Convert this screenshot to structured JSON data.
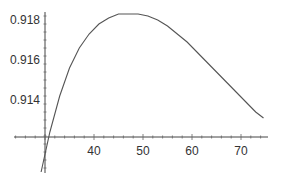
{
  "chart_data": {
    "type": "line",
    "title": "",
    "xlabel": "",
    "ylabel": "",
    "x_ticks": [
      40,
      50,
      60,
      70
    ],
    "y_ticks": [
      0.914,
      0.916,
      0.918
    ],
    "x_tick_labels": [
      "40",
      "50",
      "60",
      "70"
    ],
    "y_tick_labels": [
      "0.914",
      "0.916",
      "0.918"
    ],
    "axes_origin": {
      "x": 30,
      "y": 0.91215
    },
    "xlim": [
      27,
      76
    ],
    "ylim": [
      0.9102,
      0.9186
    ],
    "grid": false,
    "legend": null,
    "series": [
      {
        "name": "curve",
        "color": "#555555",
        "x": [
          29.2,
          31,
          33,
          35,
          37,
          39,
          41,
          43,
          45,
          47,
          49,
          51,
          53,
          55,
          57,
          59,
          61,
          63,
          65,
          67,
          69,
          71,
          73,
          74.6
        ],
        "y": [
          0.9104,
          0.9124,
          0.9142,
          0.9156,
          0.9166,
          0.9173,
          0.9178,
          0.9181,
          0.9183,
          0.9183,
          0.9183,
          0.9182,
          0.918,
          0.9177,
          0.9173,
          0.9169,
          0.9164,
          0.9159,
          0.9154,
          0.9149,
          0.9144,
          0.9139,
          0.9134,
          0.9131
        ]
      }
    ]
  }
}
